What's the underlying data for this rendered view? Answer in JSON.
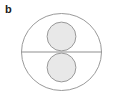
{
  "figure": {
    "panel_label": "b",
    "width": 113,
    "height": 101,
    "background_color": "#ffffff"
  },
  "colors": {
    "outline_stroke": "#9a9a9a",
    "inner_circle_fill": "#e8e8e8",
    "inner_circle_stroke": "#9a9a9a",
    "divider_line": "#8f8f8f",
    "outer_circle_fill": "#ffffff",
    "label_color": "#1a1a1a"
  },
  "chart_data": {
    "type": "diagram",
    "title": "b",
    "shapes": [
      {
        "name": "outer-circle",
        "kind": "circle",
        "cx": 61.5,
        "cy": 52.0,
        "rx": 40.5,
        "ry": 39.0,
        "fill": "#ffffff",
        "stroke": "#9a9a9a",
        "stroke_width": 1
      },
      {
        "name": "horizontal-divider",
        "kind": "line",
        "x1": 21.0,
        "y1": 52.0,
        "x2": 102.0,
        "y2": 52.0,
        "stroke": "#8f8f8f",
        "stroke_width": 1
      },
      {
        "name": "upper-inner-circle",
        "kind": "circle",
        "cx": 61.5,
        "cy": 36.5,
        "rx": 14.5,
        "ry": 14.5,
        "fill": "#e8e8e8",
        "stroke": "#9a9a9a",
        "stroke_width": 1
      },
      {
        "name": "lower-inner-circle",
        "kind": "circle",
        "cx": 61.5,
        "cy": 67.5,
        "rx": 14.5,
        "ry": 14.5,
        "fill": "#e8e8e8",
        "stroke": "#9a9a9a",
        "stroke_width": 1
      }
    ],
    "annotations": [
      {
        "name": "panel-label",
        "text": "b",
        "x": 5,
        "y": 9
      }
    ]
  }
}
